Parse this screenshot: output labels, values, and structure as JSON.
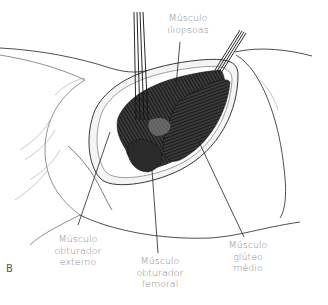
{
  "figure": {
    "panel_letter": "B",
    "labels": {
      "iliopsoas": {
        "lines": [
          "Músculo",
          "iliopsoas"
        ]
      },
      "obturador_externo": {
        "lines": [
          "Músculo",
          "obturador",
          "externo"
        ]
      },
      "obturador_femoral": {
        "lines": [
          "Músculo",
          "obturador",
          "femoral"
        ]
      },
      "gluteo_medio": {
        "lines": [
          "Músculo",
          "glúteo",
          "médio"
        ]
      }
    },
    "colors": {
      "line": "#1a1a1a",
      "muscle": "#2b2b2b",
      "label_text": "#8a8a8a"
    }
  }
}
